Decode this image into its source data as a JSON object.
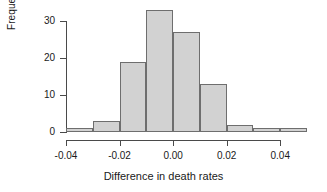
{
  "chart_data": {
    "type": "bar",
    "title": "",
    "subtitle": "",
    "xlabel": "Difference in death rates",
    "ylabel": "Frequency",
    "bin_width": 0.01,
    "bin_edges": [
      -0.04,
      -0.03,
      -0.02,
      -0.01,
      0.0,
      0.01,
      0.02,
      0.03,
      0.04,
      0.05
    ],
    "categories": [
      "-0.04",
      "-0.03",
      "-0.02",
      "-0.01",
      "0.00",
      "0.01",
      "0.02",
      "0.03",
      "0.04"
    ],
    "values": [
      1,
      3,
      19,
      33,
      27,
      13,
      2,
      1,
      1
    ],
    "xlim": [
      -0.04,
      0.05
    ],
    "ylim": [
      0,
      33
    ],
    "xticks": [
      -0.04,
      -0.02,
      0.0,
      0.02,
      0.04
    ],
    "xtick_labels": [
      "-0.04",
      "-0.02",
      "0.00",
      "0.02",
      "0.04"
    ],
    "yticks": [
      0,
      10,
      20,
      30
    ],
    "ytick_labels": [
      "0",
      "10",
      "20",
      "30"
    ],
    "grid": false,
    "legend": null,
    "bar_fill_color": "#d2d2d2",
    "bar_edge_color": "#6e6e6e",
    "axis_color": "#4a4a4a",
    "background_color": "#ffffff"
  }
}
